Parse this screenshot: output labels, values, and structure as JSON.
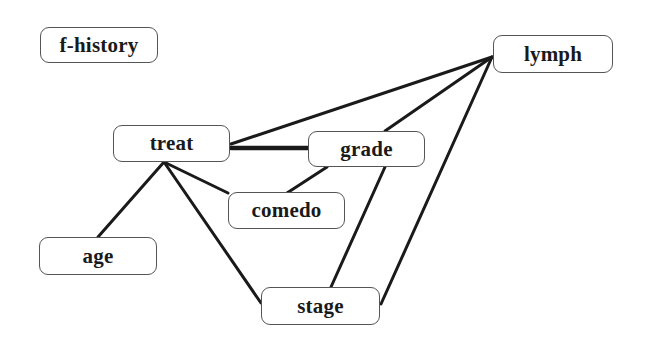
{
  "diagram": {
    "type": "undirected-graph",
    "colors": {
      "edge": "#1a1a1a",
      "node_border": "#555555",
      "text": "#1a1a1a",
      "background": "#ffffff"
    },
    "nodes": [
      {
        "id": "f-history",
        "label": "f-history",
        "x": 40,
        "y": 27,
        "w": 118,
        "h": 36
      },
      {
        "id": "lymph",
        "label": "lymph",
        "x": 493,
        "y": 35,
        "w": 120,
        "h": 38
      },
      {
        "id": "treat",
        "label": "treat",
        "x": 113,
        "y": 125,
        "w": 117,
        "h": 37
      },
      {
        "id": "grade",
        "label": "grade",
        "x": 308,
        "y": 131,
        "w": 117,
        "h": 36
      },
      {
        "id": "comedo",
        "label": "comedo",
        "x": 228,
        "y": 192,
        "w": 117,
        "h": 37
      },
      {
        "id": "age",
        "label": "age",
        "x": 39,
        "y": 237,
        "w": 118,
        "h": 38
      },
      {
        "id": "stage",
        "label": "stage",
        "x": 261,
        "y": 287,
        "w": 119,
        "h": 38
      }
    ],
    "edges": [
      {
        "from": "lymph",
        "to": "treat",
        "x1": 492,
        "y1": 57,
        "x2": 231,
        "y2": 144,
        "width": 3
      },
      {
        "from": "lymph",
        "to": "grade",
        "x1": 492,
        "y1": 57,
        "x2": 385,
        "y2": 131,
        "width": 3
      },
      {
        "from": "lymph",
        "to": "stage",
        "x1": 492,
        "y1": 57,
        "x2": 381,
        "y2": 304,
        "width": 3
      },
      {
        "from": "treat",
        "to": "grade",
        "x1": 231,
        "y1": 148,
        "x2": 308,
        "y2": 148,
        "width": 4.5
      },
      {
        "from": "treat",
        "to": "age",
        "x1": 164,
        "y1": 162,
        "x2": 98,
        "y2": 237,
        "width": 3
      },
      {
        "from": "treat",
        "to": "comedo",
        "x1": 164,
        "y1": 162,
        "x2": 228,
        "y2": 193,
        "width": 3
      },
      {
        "from": "treat",
        "to": "stage",
        "x1": 164,
        "y1": 162,
        "x2": 261,
        "y2": 303,
        "width": 3
      },
      {
        "from": "comedo",
        "to": "grade",
        "x1": 287,
        "y1": 193,
        "x2": 327,
        "y2": 167,
        "width": 3
      },
      {
        "from": "grade",
        "to": "stage",
        "x1": 385,
        "y1": 167,
        "x2": 331,
        "y2": 287,
        "width": 3
      }
    ]
  }
}
